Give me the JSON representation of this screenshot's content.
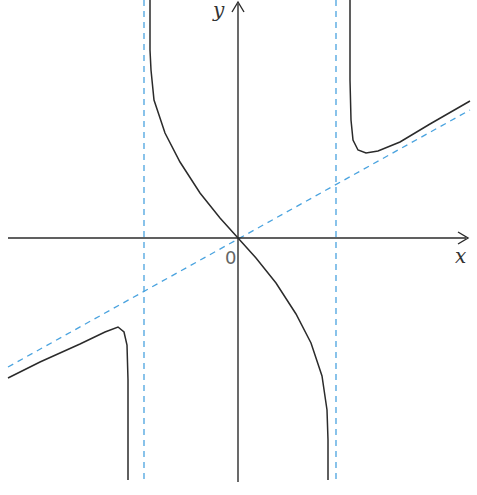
{
  "labels": {
    "x_axis": "x",
    "y_axis": "y",
    "origin": "0"
  },
  "colors": {
    "curve": "#2b2b2b",
    "axis": "#2b2b2b",
    "asymptote": "#4aa3df",
    "background": "#ffffff"
  },
  "chart_data": {
    "type": "line",
    "title": "",
    "xlabel": "x",
    "ylabel": "y",
    "grid": false,
    "asymptotes": {
      "vertical": [
        "x = -a",
        "x = a"
      ],
      "oblique": "y = m x (through origin, positive slope)"
    },
    "series": [
      {
        "name": "left branch",
        "points_px": [
          [
            8,
            378
          ],
          [
            40,
            362
          ],
          [
            80,
            344
          ],
          [
            105,
            332
          ],
          [
            118,
            327
          ],
          [
            124,
            332
          ],
          [
            127,
            345
          ],
          [
            128,
            380
          ],
          [
            128,
            480
          ]
        ]
      },
      {
        "name": "middle branch",
        "points_px": [
          [
            150,
            0
          ],
          [
            150,
            50
          ],
          [
            151,
            70
          ],
          [
            154,
            100
          ],
          [
            165,
            133
          ],
          [
            180,
            162
          ],
          [
            200,
            193
          ],
          [
            220,
            218
          ],
          [
            238,
            238
          ],
          [
            256,
            258
          ],
          [
            276,
            283
          ],
          [
            296,
            314
          ],
          [
            311,
            343
          ],
          [
            322,
            376
          ],
          [
            327,
            410
          ],
          [
            328,
            440
          ],
          [
            328,
            480
          ]
        ]
      },
      {
        "name": "right branch",
        "points_px": [
          [
            350,
            0
          ],
          [
            350,
            80
          ],
          [
            351,
            120
          ],
          [
            353,
            140
          ],
          [
            358,
            150
          ],
          [
            366,
            153
          ],
          [
            378,
            151
          ],
          [
            400,
            142
          ],
          [
            430,
            124
          ],
          [
            470,
            101
          ]
        ]
      }
    ],
    "origin_px": [
      238,
      238
    ]
  }
}
